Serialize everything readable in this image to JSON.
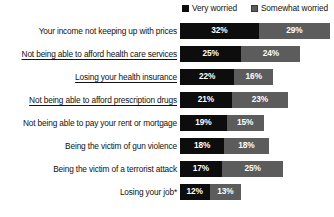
{
  "legend": {
    "position": "top-right",
    "items": [
      {
        "label": "Very worried",
        "color": "#0d0d0d",
        "swatch": "legend-swatch-icon"
      },
      {
        "label": "Somewhat worried",
        "color": "#5c5c5c",
        "swatch": "legend-swatch-icon"
      }
    ]
  },
  "axis": {
    "max_percent": 61,
    "unit": "%"
  },
  "rows": [
    {
      "label": "Your income not keeping up with prices",
      "underlined": false,
      "very": "32%",
      "somewhat": "29%",
      "very_value": 32,
      "somewhat_value": 29
    },
    {
      "label": "Not being able to afford health care services",
      "underlined": true,
      "very": "25%",
      "somewhat": "24%",
      "very_value": 25,
      "somewhat_value": 24
    },
    {
      "label": "Losing your health insurance",
      "underlined": true,
      "very": "22%",
      "somewhat": "16%",
      "very_value": 22,
      "somewhat_value": 16
    },
    {
      "label": "Not being able to afford prescription drugs",
      "underlined": true,
      "very": "21%",
      "somewhat": "23%",
      "very_value": 21,
      "somewhat_value": 23
    },
    {
      "label": "Not being able to pay your rent or mortgage",
      "underlined": false,
      "very": "19%",
      "somewhat": "15%",
      "very_value": 19,
      "somewhat_value": 15
    },
    {
      "label": "Being the victim of gun violence",
      "underlined": false,
      "very": "18%",
      "somewhat": "18%",
      "very_value": 18,
      "somewhat_value": 18
    },
    {
      "label": "Being the victim of a terrorist attack",
      "underlined": false,
      "very": "17%",
      "somewhat": "25%",
      "very_value": 17,
      "somewhat_value": 25
    },
    {
      "label": "Losing your job*",
      "underlined": false,
      "very": "12%",
      "somewhat": "13%",
      "very_value": 12,
      "somewhat_value": 13
    }
  ],
  "chart_data": {
    "type": "bar",
    "orientation": "horizontal",
    "stacked": true,
    "title": "",
    "subtitle": "",
    "xlabel": "",
    "ylabel": "",
    "xlim": [
      0,
      61
    ],
    "grid": false,
    "legend_position": "top-right",
    "categories": [
      "Your income not keeping up with prices",
      "Not being able to afford health care services",
      "Losing your health insurance",
      "Not being able to afford prescription drugs",
      "Not being able to pay your rent or mortgage",
      "Being the victim of gun violence",
      "Being the victim of a terrorist attack",
      "Losing your job*"
    ],
    "series": [
      {
        "name": "Very worried",
        "color": "#0d0d0d",
        "values": [
          32,
          25,
          22,
          21,
          19,
          18,
          17,
          12
        ]
      },
      {
        "name": "Somewhat worried",
        "color": "#5c5c5c",
        "values": [
          29,
          24,
          16,
          23,
          15,
          18,
          25,
          13
        ]
      }
    ],
    "totals": [
      61,
      49,
      38,
      44,
      34,
      36,
      42,
      25
    ],
    "data_labels": [
      [
        "32%",
        "29%"
      ],
      [
        "25%",
        "24%"
      ],
      [
        "22%",
        "16%"
      ],
      [
        "21%",
        "23%"
      ],
      [
        "19%",
        "15%"
      ],
      [
        "18%",
        "18%"
      ],
      [
        "17%",
        "25%"
      ],
      [
        "12%",
        "13%"
      ]
    ],
    "annotations": [
      "* asterisk on 'Losing your job'"
    ]
  }
}
